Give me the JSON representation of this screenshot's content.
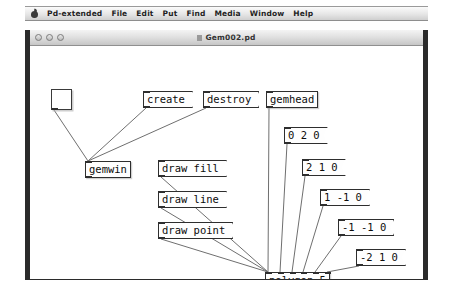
{
  "menubar": {
    "apple_icon": "apple-icon",
    "items": [
      {
        "label": "Pd-extended"
      },
      {
        "label": "File"
      },
      {
        "label": "Edit"
      },
      {
        "label": "Put"
      },
      {
        "label": "Find"
      },
      {
        "label": "Media"
      },
      {
        "label": "Window"
      },
      {
        "label": "Help"
      }
    ]
  },
  "window": {
    "title": "Gem002.pd",
    "doc_icon": "document-icon",
    "controls": [
      {
        "name": "close-button"
      },
      {
        "name": "minimize-button"
      },
      {
        "name": "zoom-button"
      }
    ]
  },
  "canvas": {
    "toggle": {
      "name": "toggle-object",
      "label": ""
    },
    "objects": [
      {
        "id": "create",
        "kind": "message",
        "label": "create",
        "x": 113,
        "y": 45,
        "inlets": 1,
        "outlets": 1
      },
      {
        "id": "destroy",
        "kind": "message",
        "label": "destroy",
        "x": 173,
        "y": 45,
        "inlets": 1,
        "outlets": 1
      },
      {
        "id": "gemhead",
        "kind": "object",
        "label": "gemhead",
        "x": 236,
        "y": 45,
        "inlets": 1,
        "outlets": 1
      },
      {
        "id": "gemwin",
        "kind": "object",
        "label": "gemwin",
        "x": 55,
        "y": 115,
        "inlets": 1,
        "outlets": 1
      },
      {
        "id": "draw_fill",
        "kind": "message",
        "label": "draw fill",
        "x": 128,
        "y": 114,
        "inlets": 1,
        "outlets": 1
      },
      {
        "id": "draw_line",
        "kind": "message",
        "label": "draw line",
        "x": 128,
        "y": 145,
        "inlets": 1,
        "outlets": 1
      },
      {
        "id": "draw_point",
        "kind": "message",
        "label": "draw point",
        "x": 128,
        "y": 176,
        "inlets": 1,
        "outlets": 1
      },
      {
        "id": "coord_0_2_0",
        "kind": "message",
        "label": "0 2 0",
        "x": 254,
        "y": 81,
        "inlets": 1,
        "outlets": 1
      },
      {
        "id": "coord_2_1_0",
        "kind": "message",
        "label": "2 1 0",
        "x": 272,
        "y": 113,
        "inlets": 1,
        "outlets": 1
      },
      {
        "id": "coord_1_n1_0",
        "kind": "message",
        "label": "1 -1 0",
        "x": 290,
        "y": 143,
        "inlets": 1,
        "outlets": 1
      },
      {
        "id": "coord_n1_n1_0",
        "kind": "message",
        "label": "-1 -1 0",
        "x": 308,
        "y": 173,
        "inlets": 1,
        "outlets": 1
      },
      {
        "id": "coord_n2_1_0",
        "kind": "message",
        "label": "-2 1 0",
        "x": 326,
        "y": 203,
        "inlets": 1,
        "outlets": 1
      },
      {
        "id": "polygon",
        "kind": "object",
        "label": "polygon 5",
        "x": 235,
        "y": 226,
        "inlets": 6,
        "outlets": 1
      }
    ],
    "connections": [
      {
        "from": "toggle",
        "to": "gemwin"
      },
      {
        "from": "create",
        "to": "gemwin"
      },
      {
        "from": "destroy",
        "to": "gemwin"
      },
      {
        "from": "draw_fill",
        "to": "polygon"
      },
      {
        "from": "draw_line",
        "to": "polygon"
      },
      {
        "from": "draw_point",
        "to": "polygon"
      },
      {
        "from": "gemhead",
        "to": "polygon"
      },
      {
        "from": "coord_0_2_0",
        "to": "polygon"
      },
      {
        "from": "coord_2_1_0",
        "to": "polygon"
      },
      {
        "from": "coord_1_n1_0",
        "to": "polygon"
      },
      {
        "from": "coord_n1_n1_0",
        "to": "polygon"
      },
      {
        "from": "coord_n2_1_0",
        "to": "polygon"
      }
    ]
  }
}
